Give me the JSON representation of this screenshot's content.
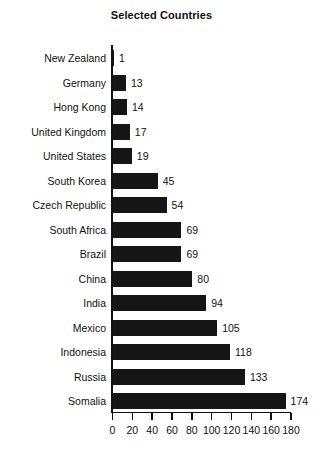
{
  "chart_data": {
    "type": "bar",
    "orientation": "horizontal",
    "title": "Selected Countries",
    "xlabel": "",
    "ylabel": "",
    "xlim": [
      0,
      180
    ],
    "grid": false,
    "legend": null,
    "bar_color": "#161616",
    "axis_color": "#111111",
    "background": "#ffffff",
    "xticks": [
      0,
      20,
      40,
      60,
      80,
      100,
      120,
      140,
      160,
      180
    ],
    "xtick_labels": [
      "0",
      "20",
      "40",
      "60",
      "80",
      "100",
      "120",
      "140",
      "160",
      "180"
    ],
    "categories": [
      "New Zealand",
      "Germany",
      "Hong Kong",
      "United Kingdom",
      "United States",
      "South Korea",
      "Czech Republic",
      "South Africa",
      "Brazil",
      "China",
      "India",
      "Mexico",
      "Indonesia",
      "Russia",
      "Somalia"
    ],
    "values": [
      1,
      13,
      14,
      17,
      19,
      45,
      54,
      69,
      69,
      80,
      94,
      105,
      118,
      133,
      174
    ],
    "data_labels": [
      "1",
      "13",
      "14",
      "17",
      "19",
      "45",
      "54",
      "69",
      "69",
      "80",
      "94",
      "105",
      "118",
      "133",
      "174"
    ]
  }
}
